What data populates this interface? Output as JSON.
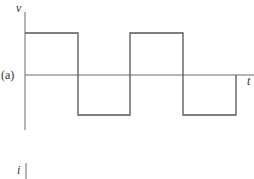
{
  "figure": {
    "panel_label": "(a)",
    "top_plot": {
      "y_axis_label": "v",
      "x_axis_label": "t",
      "waveform": "square",
      "levels": {
        "high": 33,
        "zero": 75,
        "low": 115
      },
      "transitions_x": [
        25,
        78,
        130,
        183,
        236
      ],
      "start_level": "high"
    },
    "bottom_plot": {
      "y_axis_label": "i"
    },
    "colors": {
      "line": "#555555",
      "text": "#333333",
      "background": "#ffffff"
    }
  }
}
